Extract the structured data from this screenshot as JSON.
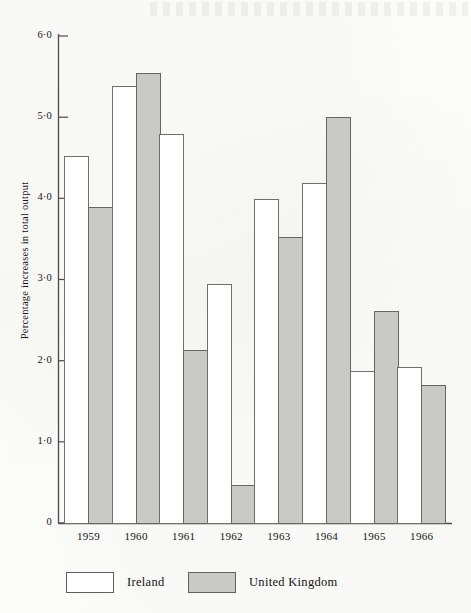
{
  "chart_data": {
    "type": "bar",
    "title": "",
    "xlabel": "",
    "ylabel": "Percentage increases in total output",
    "categories": [
      "1959",
      "1960",
      "1961",
      "1962",
      "1963",
      "1964",
      "1965",
      "1966"
    ],
    "series": [
      {
        "name": "Ireland",
        "values": [
          4.52,
          5.39,
          4.8,
          2.95,
          4.0,
          4.19,
          1.88,
          1.93
        ]
      },
      {
        "name": "United Kingdom",
        "values": [
          3.9,
          5.55,
          2.14,
          0.48,
          3.53,
          5.0,
          2.62,
          1.7
        ]
      }
    ],
    "ylim": [
      0,
      6.0
    ],
    "ytick_values": [
      0,
      1.0,
      2.0,
      3.0,
      4.0,
      5.0,
      6.0
    ],
    "ytick_labels": [
      "0",
      "1·0",
      "2·0",
      "3·0",
      "4·0",
      "5·0",
      "6·0"
    ],
    "grid": false,
    "legend_position": "bottom-left",
    "colors": {
      "ireland_fill": "#fefefe",
      "ireland_stroke": "#6f6f6f",
      "uk_fill": "#c9c9c6",
      "uk_stroke": "#666663",
      "axis": "#555555",
      "background": "#fdfdfb"
    }
  },
  "legend": {
    "items": [
      {
        "label": "Ireland",
        "swatch": "white-swatch"
      },
      {
        "label": "United Kingdom",
        "swatch": "grey-swatch"
      }
    ]
  }
}
